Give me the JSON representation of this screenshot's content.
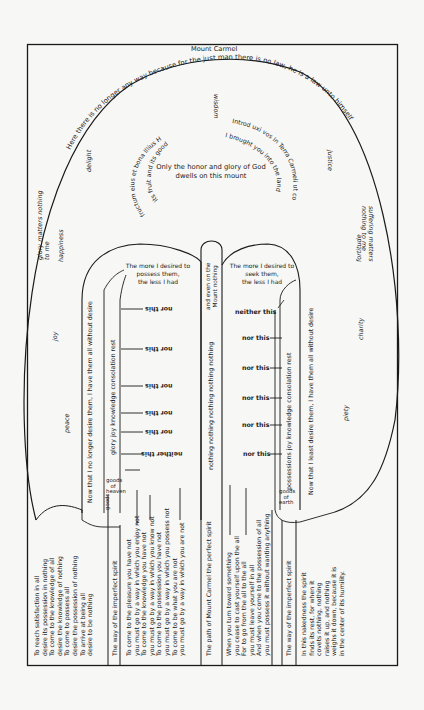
{
  "diagram": {
    "title": "Mount Carmel",
    "summit_arc": "Here there is no longer any way because for the just man there is no law, he is a law unto himself",
    "summit_center": {
      "line1": "Only the honor and glory of God",
      "line2": "dwells on this mount"
    },
    "inner_ring_left": [
      "Hier. 2",
      "Illius",
      "bona",
      "et",
      "eius",
      "fructum",
      "its good things, (Jer. 2,7)",
      "its fruit and"
    ],
    "inner_ring_right": [
      "Introd",
      "uxi",
      "vos",
      "in",
      "Terra",
      "Carmeli",
      "ut",
      "comederetis",
      "I brought you into the land of Carmel to eat"
    ],
    "virtues": {
      "top": "wisdom",
      "upper_left": "delight",
      "upper_right": "justice",
      "left_1": "glory matters nothing to me",
      "left_2": "happiness",
      "left_3": "joy",
      "left_4": "peace",
      "right_1": "suffering matters nothing to me",
      "right_2": "fortitude",
      "right_3": "charity",
      "right_4": "piety"
    },
    "left_tower": {
      "arch": [
        "The more I desired to",
        "possess them,",
        "the less I had"
      ],
      "side_label": "Now that I no longer desire them, I have them all without desire",
      "inner_label": "glory joy knowledge consolation rest",
      "base_label": [
        "goods",
        "of",
        "heaven"
      ],
      "branches": [
        "nor this",
        "nor this",
        "nor this",
        "nor this",
        "nor this",
        "neither this"
      ]
    },
    "center_column": {
      "top": [
        "and even on the",
        "Mount nothing"
      ],
      "body": "nothing nothing nothing nothing nothing"
    },
    "right_tower": {
      "arch": [
        "The more I desired to",
        "seek them,",
        "the less I had"
      ],
      "side_label": "Now that I least desire them, I have them all without desire",
      "inner_label": "possessions joy knowledge consolation rest",
      "base_label": [
        "goods",
        "of",
        "earth"
      ],
      "branches": [
        "neither this",
        "nor this",
        "nor this",
        "nor this",
        "nor this",
        "nor this"
      ]
    },
    "bottom_columns": [
      {
        "lines": [
          "To reach satisfaction in all",
          "desire its possession in nothing",
          "To come to the knowledge of all",
          "desire the knowledge of nothing",
          "To come to possess all",
          "desire the possession of nothing",
          "To arrive at being all",
          "desire to be nothing"
        ]
      },
      {
        "lines": [
          "The way of the imperfect spirit"
        ]
      },
      {
        "lines": [
          "To come to the pleasure you have not",
          "you must go by a way in which you enjoy not",
          "To come to the knowledge you have not",
          "you must go by a way in which you know not",
          "To come to the possession you have not",
          "you must go by a way in which you possess not",
          "To come to be what you are not",
          "you must go by a way in which you are not"
        ]
      },
      {
        "lines": [
          "The path of Mount Carmel the perfect spirit"
        ]
      },
      {
        "lines": [
          "When you turn toward something",
          "you cease to cast yourself upon the all",
          "For to go from the all to the all",
          "you must leave yourself in all",
          "And when you come to the possession of all",
          "you must possess it without wanting anything"
        ]
      },
      {
        "lines": [
          "The way of the imperfect spirit"
        ]
      },
      {
        "lines": [
          "In this nakedness the spirit",
          "finds its rest, for when it",
          "covets nothing, nothing",
          "raises it up, and nothing",
          "weighs it down, because it is",
          "in the center of its humility."
        ]
      }
    ]
  }
}
